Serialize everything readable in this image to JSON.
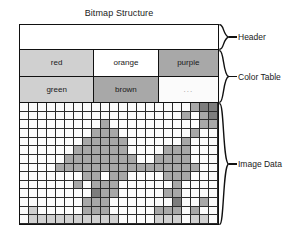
{
  "title": "Bitmap Structure",
  "sections": [
    {
      "id": "header",
      "label": "Header"
    },
    {
      "id": "color-table",
      "label": "Color Table"
    },
    {
      "id": "image-data",
      "label": "Image Data"
    }
  ],
  "header_block": {
    "content": ""
  },
  "color_table": {
    "rows": [
      [
        {
          "label": "red",
          "swatch": "#d0d0d0"
        },
        {
          "label": "orange",
          "swatch": "#ffffff"
        },
        {
          "label": "purple",
          "swatch": "#a8a8a8"
        }
      ],
      [
        {
          "label": "green",
          "swatch": "#d0d0d0"
        },
        {
          "label": "brown",
          "swatch": "#a8a8a8"
        },
        {
          "label": "...",
          "swatch": "#fbfbfb"
        }
      ]
    ]
  },
  "palette": {
    "white": "#fbfbfb",
    "light": "#d0d0d0",
    "medium": "#a8a8a8",
    "dark": "#7d7d7d",
    "grid_line": "#2b2b2b",
    "outline": "#111111"
  },
  "image_grid": {
    "cols": 22,
    "rows": 14,
    "legend": {
      "0": "white",
      "1": "light",
      "2": "medium",
      "3": "dark"
    },
    "pixels": [
      [
        0,
        0,
        0,
        0,
        0,
        0,
        0,
        0,
        0,
        0,
        0,
        0,
        0,
        0,
        0,
        0,
        0,
        0,
        0,
        2,
        3,
        3
      ],
      [
        0,
        0,
        0,
        0,
        0,
        0,
        0,
        0,
        0,
        0,
        0,
        0,
        0,
        0,
        0,
        0,
        0,
        0,
        2,
        0,
        2,
        3
      ],
      [
        0,
        0,
        0,
        0,
        0,
        0,
        0,
        0,
        0,
        2,
        0,
        0,
        0,
        0,
        0,
        0,
        0,
        0,
        0,
        0,
        2,
        2
      ],
      [
        0,
        0,
        0,
        0,
        0,
        0,
        0,
        0,
        2,
        2,
        2,
        0,
        0,
        0,
        0,
        0,
        0,
        0,
        0,
        2,
        0,
        0
      ],
      [
        0,
        0,
        0,
        0,
        0,
        0,
        0,
        2,
        2,
        2,
        2,
        2,
        0,
        0,
        0,
        0,
        0,
        0,
        2,
        0,
        0,
        0
      ],
      [
        0,
        0,
        0,
        0,
        0,
        0,
        2,
        2,
        2,
        2,
        2,
        2,
        0,
        0,
        0,
        0,
        2,
        2,
        2,
        0,
        0,
        0
      ],
      [
        0,
        0,
        0,
        0,
        0,
        2,
        2,
        2,
        2,
        2,
        2,
        2,
        2,
        0,
        0,
        2,
        2,
        2,
        2,
        0,
        0,
        0
      ],
      [
        0,
        0,
        0,
        0,
        2,
        2,
        2,
        2,
        2,
        2,
        2,
        2,
        2,
        2,
        2,
        2,
        2,
        2,
        2,
        2,
        0,
        0
      ],
      [
        0,
        0,
        0,
        0,
        0,
        0,
        0,
        2,
        2,
        0,
        2,
        2,
        0,
        0,
        0,
        0,
        2,
        2,
        2,
        0,
        0,
        0
      ],
      [
        0,
        0,
        0,
        0,
        0,
        0,
        2,
        0,
        2,
        2,
        2,
        0,
        0,
        0,
        0,
        0,
        0,
        2,
        0,
        0,
        0,
        0
      ],
      [
        0,
        0,
        0,
        0,
        0,
        0,
        0,
        0,
        3,
        2,
        2,
        0,
        0,
        0,
        0,
        0,
        2,
        2,
        0,
        0,
        0,
        0
      ],
      [
        0,
        0,
        0,
        0,
        0,
        0,
        0,
        2,
        2,
        2,
        0,
        0,
        0,
        0,
        0,
        0,
        0,
        3,
        0,
        0,
        2,
        0
      ],
      [
        0,
        1,
        0,
        0,
        0,
        0,
        0,
        2,
        2,
        2,
        0,
        0,
        0,
        0,
        0,
        2,
        2,
        2,
        0,
        2,
        0,
        0
      ],
      [
        0,
        1,
        1,
        1,
        1,
        1,
        1,
        1,
        1,
        1,
        1,
        0,
        0,
        0,
        0,
        1,
        1,
        1,
        0,
        1,
        1,
        0
      ]
    ]
  }
}
